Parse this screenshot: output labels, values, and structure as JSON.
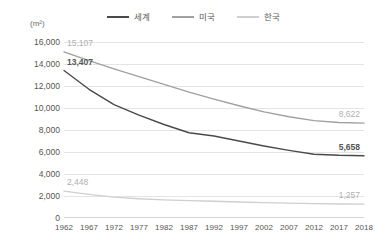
{
  "unit_label": "(m²)",
  "colors": {
    "world": "#4a4a4a",
    "usa": "#a0a0a0",
    "korea": "#cfcfcf",
    "grid": "#e4e4e4",
    "text": "#555555",
    "annotation_muted": "#b0b0b0"
  },
  "legend": {
    "items": [
      {
        "label": "세계",
        "color": "#4a4a4a",
        "key": "world"
      },
      {
        "label": "미국",
        "color": "#a0a0a0",
        "key": "usa"
      },
      {
        "label": "한국",
        "color": "#cfcfcf",
        "key": "korea"
      }
    ]
  },
  "annotations": [
    {
      "text": "15,107",
      "series": "usa",
      "x": 1962,
      "value": 15107,
      "style": "muted"
    },
    {
      "text": "13,407",
      "series": "world",
      "x": 1962,
      "value": 13407,
      "style": "bold"
    },
    {
      "text": "2,448",
      "series": "korea",
      "x": 1962,
      "value": 2448,
      "style": "muted"
    },
    {
      "text": "8,622",
      "series": "usa",
      "x": 2018,
      "value": 8622,
      "style": "muted"
    },
    {
      "text": "5,658",
      "series": "world",
      "x": 2018,
      "value": 5658,
      "style": "bold"
    },
    {
      "text": "1,257",
      "series": "korea",
      "x": 2018,
      "value": 1257,
      "style": "muted"
    }
  ],
  "chart_data": {
    "type": "line",
    "title": "",
    "xlabel": "",
    "ylabel": "(m²)",
    "ylim": [
      0,
      16000
    ],
    "ytick_values": [
      0,
      2000,
      4000,
      6000,
      8000,
      10000,
      12000,
      14000,
      16000
    ],
    "ytick_labels": [
      "0",
      "2,000",
      "4,000",
      "6,000",
      "8,000",
      "10,000",
      "12,000",
      "14,000",
      "16,000"
    ],
    "categories": [
      1962,
      1967,
      1972,
      1977,
      1982,
      1987,
      1992,
      1997,
      2002,
      2007,
      2012,
      2017,
      2018
    ],
    "xtick_labels": [
      "1962",
      "1967",
      "1972",
      "1977",
      "1982",
      "1987",
      "1992",
      "1997",
      "2002",
      "2007",
      "2012",
      "2017",
      "2018"
    ],
    "grid": true,
    "grid_axis": "y",
    "legend_position": "top-center",
    "series": [
      {
        "name": "세계",
        "key": "world",
        "color": "#4a4a4a",
        "values": [
          13407,
          11700,
          10300,
          9350,
          8500,
          7750,
          7450,
          7000,
          6550,
          6150,
          5800,
          5700,
          5658
        ]
      },
      {
        "name": "미국",
        "key": "usa",
        "color": "#a0a0a0",
        "values": [
          15107,
          14300,
          13550,
          12850,
          12150,
          11450,
          10800,
          10200,
          9650,
          9200,
          8850,
          8680,
          8622
        ]
      },
      {
        "name": "한국",
        "key": "korea",
        "color": "#cfcfcf",
        "values": [
          2448,
          2150,
          1900,
          1750,
          1650,
          1580,
          1520,
          1460,
          1400,
          1350,
          1310,
          1270,
          1257
        ]
      }
    ]
  }
}
